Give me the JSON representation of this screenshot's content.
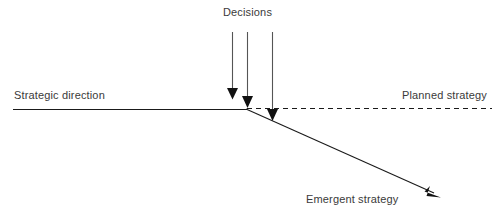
{
  "diagram": {
    "type": "line-diagram",
    "canvas": {
      "width": 498,
      "height": 223,
      "background": "#ffffff"
    },
    "stroke_color": "#1a1a1a",
    "text_color": "#3a3a3a",
    "labels": {
      "decisions": "Decisions",
      "strategic_direction": "Strategic direction",
      "planned_strategy": "Planned strategy",
      "emergent_strategy": "Emergent strategy"
    },
    "elements": {
      "strategic_direction_line": {
        "name": "strategic-direction-line",
        "style": "solid",
        "x1": 13,
        "y1": 109,
        "x2": 247,
        "y2": 109
      },
      "planned_strategy_line": {
        "name": "planned-strategy-dashed-line",
        "style": "dashed",
        "x1": 247,
        "y1": 108,
        "x2": 492,
        "y2": 108
      },
      "emergent_strategy_line": {
        "name": "emergent-strategy-arrow",
        "style": "solid-arrow",
        "x1": 246,
        "y1": 109,
        "x2": 441,
        "y2": 197
      },
      "decision_arrows": [
        {
          "name": "decision-arrow-1",
          "x": 232,
          "y1": 32,
          "y2": 99
        },
        {
          "name": "decision-arrow-2",
          "x": 247,
          "y1": 32,
          "y2": 108
        },
        {
          "name": "decision-arrow-3",
          "x": 272,
          "y1": 32,
          "y2": 121
        }
      ]
    }
  }
}
